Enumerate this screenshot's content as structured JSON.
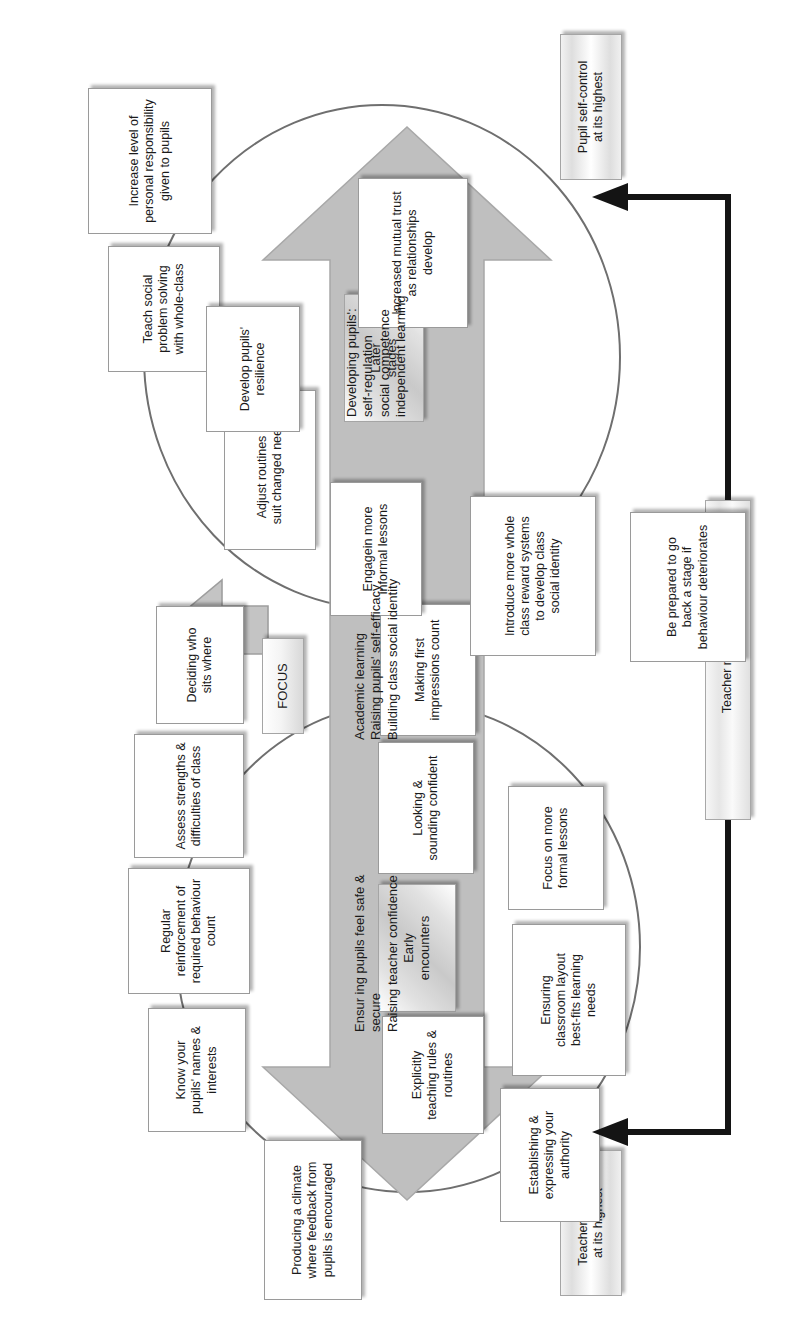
{
  "diagram": {
    "stages": {
      "early": "Early\nencounters",
      "later": "Later\nstages"
    },
    "focus_label": "FOCUS",
    "early_encounters_nodes": [
      "Producing a climate\nwhere feedback from\npupils is encouraged",
      "Know your\npupils' names &\ninterests",
      "Regular\nreinforcement of\nrequired behaviour\ncount",
      "Assess strengths &\ndifficulties of class",
      "Deciding who\nsits where",
      "Explicitly\nteaching rules &\nroutines",
      "Looking &\nsounding confident",
      "Making first\nimpressions count",
      "Establishing &\nexpressing your\nauthority",
      "Ensuring\nclassroom layout\nbest-fits learning\nneeds",
      "Focus on more\nformal lessons"
    ],
    "later_stages_nodes": [
      "Adjust routines to\nsuit changed needs",
      "Teach social\nproblem solving\nwith whole-class",
      "Increase level of\npersonal responsibility\ngiven to pupils",
      "Increased mutual trust\nas relationships\ndevelop",
      "Develop pupils'\nresilience",
      "Introduce more whole\nclass reward systems\nto develop class\nsocial identity",
      "Engagein more\ninformal lessons",
      "Be prepared to go\nback a stage if\nbehaviour deteriorates"
    ],
    "arrow_up_text": "Developing pupils':\nself-regulation\nsocial competence\nindependent learning",
    "arrow_mid_text": "Academic learning\nRaising pupils' self-efficacy\nBuilding class social identity",
    "arrow_down_text": "Ensur ing pupils feel safe &\nsecure\nRaising teacher confidence",
    "endpoints": {
      "top": "Pupil self-control\nat its highest",
      "bottom": "Teacher control\nat its highest"
    },
    "monitoring_label": "Teacher monitoring",
    "colors": {
      "arrow_fill": "#bfbfbf",
      "arrow_stroke": "#a0a0a0",
      "connector": "#6f6f6f",
      "black_arrow": "#141414",
      "node_border": "#9a9a9a"
    }
  }
}
